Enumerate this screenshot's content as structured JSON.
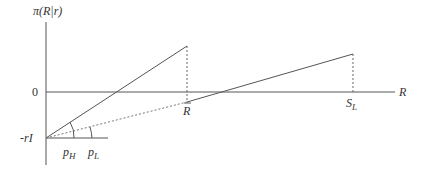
{
  "diagram": {
    "y_axis_label": "π(R|r)",
    "x_axis_label": "R",
    "zero_label": "0",
    "intercept_label": "-rI",
    "rbar_label": "R",
    "sl_label": "S",
    "sl_subscript": "L",
    "ph_label": "p",
    "ph_subscript": "H",
    "pl_label": "p",
    "pl_subscript": "L",
    "colors": {
      "line": "#444444",
      "text": "#333333",
      "background": "#ffffff"
    }
  }
}
